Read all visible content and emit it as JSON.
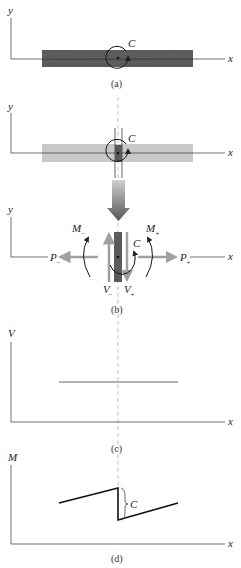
{
  "figure": {
    "panels": [
      {
        "id": "a",
        "caption": "(a)",
        "y_label": "y",
        "x_label": "x",
        "couple_label": "C"
      },
      {
        "id": "a2",
        "y_label": "y",
        "x_label": "x",
        "couple_label": "C"
      },
      {
        "id": "b",
        "caption": "(b)",
        "y_label": "y",
        "x_label": "x",
        "couple_label": "C",
        "labels": {
          "M_minus": "M",
          "M_minus_sub": "−",
          "M_plus": "M",
          "M_plus_sub": "+",
          "P_minus": "P",
          "P_minus_sub": "−",
          "P_plus": "P",
          "P_plus_sub": "+",
          "V_minus": "V",
          "V_minus_sub": "−",
          "V_plus": "V",
          "V_plus_sub": "+"
        }
      },
      {
        "id": "c",
        "caption": "(c)",
        "y_label": "V",
        "x_label": "x"
      },
      {
        "id": "d",
        "caption": "(d)",
        "y_label": "M",
        "x_label": "x",
        "jump_label": "C"
      }
    ]
  },
  "colors": {
    "beam_dark": "#555555",
    "beam_light": "#c8c8c8",
    "force_arrow": "#a0a0a0",
    "line": "#222222",
    "shear_line": "#9a9a9a"
  }
}
